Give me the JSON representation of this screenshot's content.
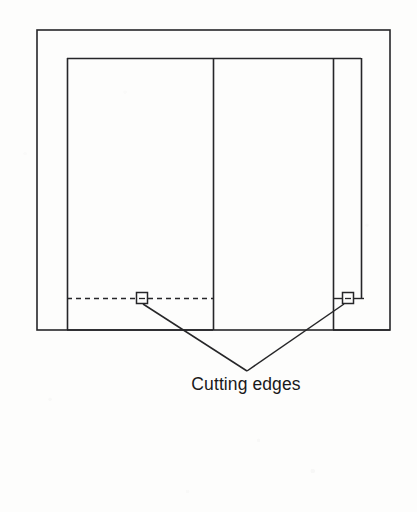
{
  "figure": {
    "kind": "technical-line-drawing",
    "title_text": "Cutting edges",
    "background_color": "#fdfdfc",
    "line_color": "#262628",
    "callout_label": "Cutting edges",
    "annotations": [
      {
        "name": "cutting-edge-marker-left",
        "x": 142,
        "y": 298
      },
      {
        "name": "cutting-edge-marker-right",
        "x": 348,
        "y": 298
      }
    ],
    "geometry": {
      "outer_rect": {
        "x1": 37,
        "y1": 30,
        "x2": 390,
        "y2": 330
      },
      "inner_rect_top": {
        "x1": 67,
        "y1": 58,
        "x2": 361
      },
      "left_panel": {
        "x1": 67,
        "y1": 58,
        "x2": 213,
        "y2": 330
      },
      "divider_line_x": 213,
      "right_column_x": 333,
      "inner_right_edge_x": 361,
      "dashed_line_y": 298,
      "dashed_line_x1": 67,
      "dashed_line_x2": 213,
      "leader_vertex": {
        "x": 247,
        "y": 371
      },
      "label_position": {
        "x": 246,
        "y": 389
      }
    }
  }
}
